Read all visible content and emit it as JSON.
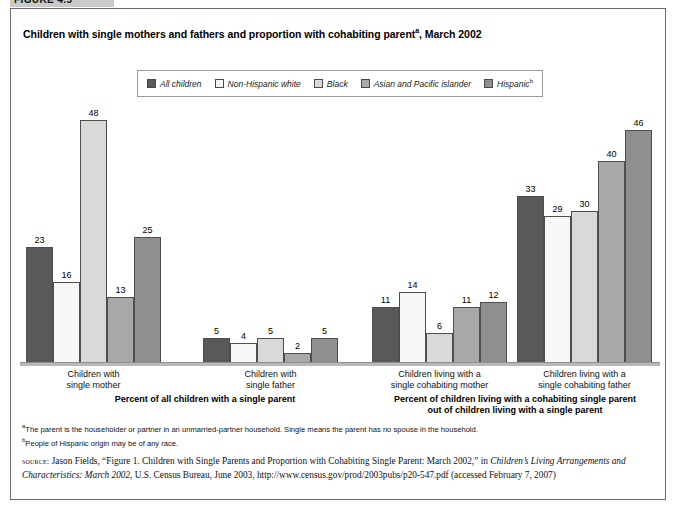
{
  "figure_tab": "FIGURE 4.5",
  "title_main": "Children with single mothers and fathers and proportion with cohabiting parent",
  "title_sup": "a",
  "title_tail": ", March 2002",
  "legend": [
    {
      "label": "All children",
      "sup": "",
      "color": "#595959"
    },
    {
      "label": "Non-Hispanic white",
      "sup": "",
      "color": "#f7f7f7"
    },
    {
      "label": "Black",
      "sup": "",
      "color": "#d9d9d9"
    },
    {
      "label": "Asian and Pacific islander",
      "sup": "",
      "color": "#a8a8a8"
    },
    {
      "label": "Hispanic",
      "sup": "b",
      "color": "#8f8f8f"
    }
  ],
  "footnotes": [
    {
      "sup": "a",
      "text": "The parent is the householder or partner in an unmarried-partner household. Single means the parent has no spouse in the household."
    },
    {
      "sup": "b",
      "text": "People of Hispanic origin may be of any race."
    }
  ],
  "source": {
    "prefix": "source:",
    "part1": " Jason Fields, “Figure 1. Children with Single Parents and Proportion with Cohabiting Single Parent: March 2002,” in ",
    "italic1": "Children’s Living Arrangements and Characteristics: March 2002",
    "part2": ", U.S. Census Bureau, June 2003, http://www.census.gov/prod/2003pubs/p20-547.pdf (accessed February 7, 2007)"
  },
  "chart_data": {
    "type": "bar",
    "xlabel": "",
    "ylabel": "Percent",
    "ylim": [
      0,
      50
    ],
    "grid": false,
    "legend_position": "top",
    "categories": [
      "Children with single mother",
      "Children with single father",
      "Children living with a single cohabiting mother",
      "Children living with a single cohabiting father"
    ],
    "category_lines": [
      [
        "Children with",
        "single mother"
      ],
      [
        "Children with",
        "single father"
      ],
      [
        "Children living with a",
        "single cohabiting mother"
      ],
      [
        "Children living with a",
        "single cohabiting father"
      ]
    ],
    "series": [
      {
        "name": "All children",
        "color": "#595959",
        "values": [
          23,
          5,
          11,
          33
        ]
      },
      {
        "name": "Non-Hispanic white",
        "color": "#f7f7f7",
        "values": [
          16,
          4,
          14,
          29
        ]
      },
      {
        "name": "Black",
        "color": "#d9d9d9",
        "values": [
          48,
          5,
          6,
          30
        ]
      },
      {
        "name": "Asian and Pacific islander",
        "color": "#a8a8a8",
        "values": [
          13,
          2,
          11,
          40
        ]
      },
      {
        "name": "Hispanic",
        "color": "#8f8f8f",
        "values": [
          25,
          5,
          12,
          46
        ]
      }
    ],
    "section_labels": [
      {
        "lines": [
          "Percent of all children with a single parent"
        ]
      },
      {
        "lines": [
          "Percent of children living with a cohabiting single parent",
          "out of children living with a single parent"
        ]
      }
    ]
  }
}
